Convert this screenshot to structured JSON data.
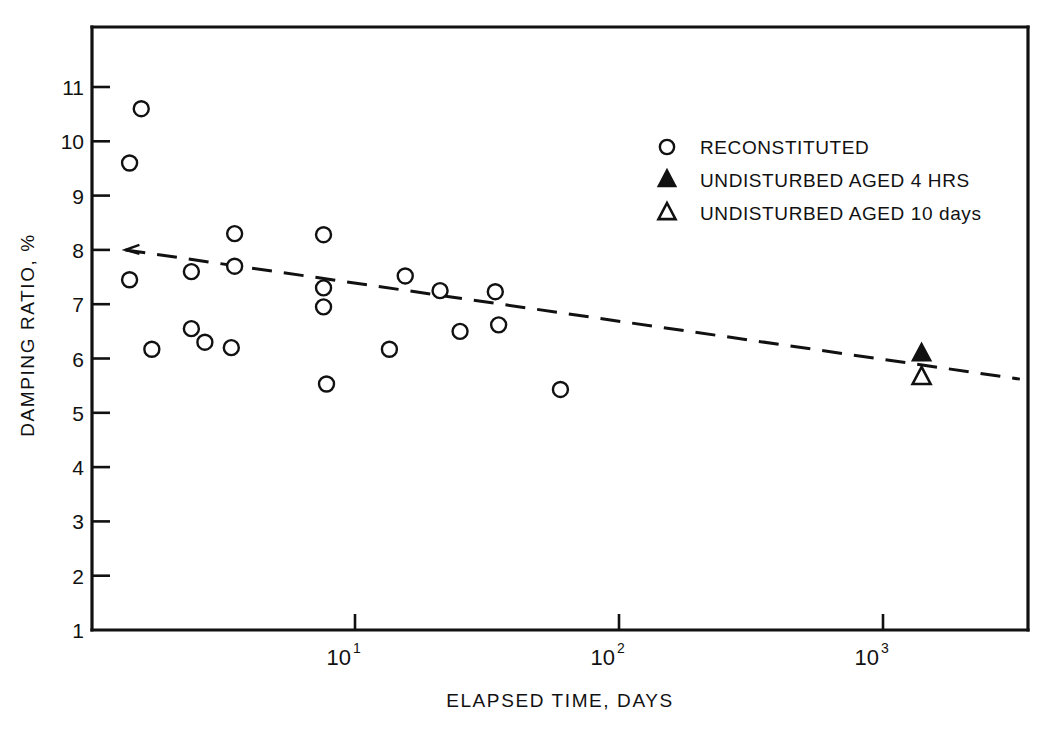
{
  "chart_data": {
    "type": "scatter",
    "title": "",
    "xlabel": "ELAPSED TIME, DAYS",
    "ylabel": "DAMPING RATIO, %",
    "xscale": "log",
    "yscale": "linear",
    "xlim": [
      1.35,
      3300
    ],
    "ylim": [
      1,
      11.6
    ],
    "grid": false,
    "x_tick_labels": [
      "10",
      "10",
      "10"
    ],
    "x_tick_exponents": [
      "1",
      "2",
      "3"
    ],
    "x_tick_values": [
      10,
      100,
      1000
    ],
    "y_ticks": [
      1,
      2,
      3,
      4,
      5,
      6,
      7,
      8,
      9,
      10,
      11
    ],
    "legend_position": "upper right",
    "legend": [
      {
        "marker": "open-circle",
        "label": "RECONSTITUTED"
      },
      {
        "marker": "filled-triangle",
        "label": "UNDISTURBED AGED  4 HRS"
      },
      {
        "marker": "open-triangle",
        "label": "UNDISTURBED AGED 10 days"
      }
    ],
    "series": [
      {
        "name": "RECONSTITUTED",
        "marker": "open-circle",
        "points": [
          {
            "x": 1.55,
            "y": 10.6
          },
          {
            "x": 1.4,
            "y": 9.6
          },
          {
            "x": 1.4,
            "y": 7.45
          },
          {
            "x": 1.7,
            "y": 6.17
          },
          {
            "x": 2.4,
            "y": 7.6
          },
          {
            "x": 2.4,
            "y": 6.55
          },
          {
            "x": 2.7,
            "y": 6.3
          },
          {
            "x": 3.5,
            "y": 8.3
          },
          {
            "x": 3.5,
            "y": 7.7
          },
          {
            "x": 3.4,
            "y": 6.2
          },
          {
            "x": 7.6,
            "y": 8.28
          },
          {
            "x": 7.6,
            "y": 7.3
          },
          {
            "x": 7.6,
            "y": 6.95
          },
          {
            "x": 7.8,
            "y": 5.53
          },
          {
            "x": 13.5,
            "y": 6.17
          },
          {
            "x": 15.5,
            "y": 7.52
          },
          {
            "x": 21.0,
            "y": 7.25
          },
          {
            "x": 25.0,
            "y": 6.5
          },
          {
            "x": 34.0,
            "y": 7.23
          },
          {
            "x": 35.0,
            "y": 6.62
          },
          {
            "x": 60.0,
            "y": 5.43
          }
        ]
      },
      {
        "name": "UNDISTURBED AGED  4 HRS",
        "marker": "filled-triangle",
        "points": [
          {
            "x": 1400,
            "y": 6.08
          }
        ]
      },
      {
        "name": "UNDISTURBED AGED 10 days",
        "marker": "open-triangle",
        "points": [
          {
            "x": 1400,
            "y": 5.65
          }
        ]
      }
    ],
    "trend_line": {
      "style": "dashed",
      "start": {
        "x": 1.35,
        "y": 8.0
      },
      "end": {
        "x": 3300,
        "y": 5.62
      }
    }
  },
  "axes": {
    "y_tick_labels": [
      "11",
      "10",
      "9",
      "8",
      "7",
      "6",
      "5",
      "4",
      "3",
      "2",
      "1"
    ],
    "x_label": "ELAPSED TIME, DAYS",
    "y_label": "DAMPING RATIO, %"
  }
}
